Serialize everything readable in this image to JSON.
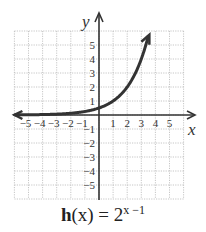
{
  "chart_data": {
    "type": "line",
    "function": "2^(x-1)",
    "xlabel": "x",
    "ylabel": "y",
    "xlim": [
      -6,
      6
    ],
    "ylim": [
      -6,
      6
    ],
    "grid": true,
    "x_tick_labels": [
      "−5",
      "−4",
      "−3",
      "−2",
      "−1",
      "1",
      "2",
      "3",
      "4",
      "5"
    ],
    "y_tick_labels": [
      "5",
      "4",
      "3",
      "2",
      "1",
      "−1",
      "−2",
      "−3",
      "−4",
      "−5"
    ],
    "x": [
      -6,
      -5,
      -4,
      -3,
      -2,
      -1,
      0,
      1,
      2,
      3,
      3.5
    ],
    "y": [
      0.0078,
      0.0156,
      0.03125,
      0.0625,
      0.125,
      0.25,
      0.5,
      1,
      2,
      4,
      5.66
    ],
    "arrows": {
      "left": "approaches y=0 as x→−∞",
      "right": "increases toward upper right"
    }
  },
  "caption": {
    "fn": "h",
    "arg": "(x) = 2",
    "exp": "x −1"
  },
  "axes": {
    "x_label": "x",
    "y_label": "y"
  },
  "colors": {
    "curve": "#333333",
    "axis": "#333333",
    "grid": "#b8b8b8"
  }
}
